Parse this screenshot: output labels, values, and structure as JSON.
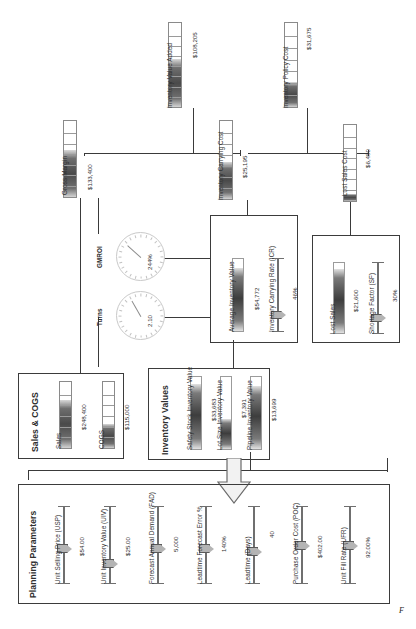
{
  "diagram": {
    "corner_mark": "F"
  },
  "top_metrics": [
    {
      "id": "inventory_value_added",
      "label": "Inventory Value Added",
      "value": "$108,205",
      "fill_pct": 57
    },
    {
      "id": "inventory_policy_cost",
      "label": "Inventory Policy Cost",
      "value": "$31,675",
      "fill_pct": 30
    },
    {
      "id": "gross_margin",
      "label": "Gross Margin",
      "value": "$133,400",
      "fill_pct": 62
    },
    {
      "id": "inventory_carrying_cost",
      "label": "Inventory Carrying Cost",
      "value": "$25,195",
      "fill_pct": 47
    },
    {
      "id": "lost_sales_cost",
      "label": "Lost Sales Cost",
      "value": "$6,480",
      "fill_pct": 9
    }
  ],
  "gauges": [
    {
      "id": "gmroi",
      "label": "GMROI",
      "value": "244%",
      "angle": 58
    },
    {
      "id": "turns",
      "label": "Turns",
      "value": "2.10",
      "angle": 40
    }
  ],
  "avg_inventory_group": {
    "title": "",
    "items": [
      {
        "id": "average_inventory_value",
        "label": "Average Inventory Value",
        "value": "$54,772",
        "type": "bar",
        "fill_pct": 88
      },
      {
        "id": "inventory_carrying_rate",
        "label": "Inventory Carrying Rate (ICR)",
        "value": "46%",
        "type": "slider",
        "pos_pct": 46
      }
    ]
  },
  "lost_sales_group": {
    "title": "",
    "items": [
      {
        "id": "lost_sales",
        "label": "Lost Sales",
        "value": "$21,600",
        "type": "bar",
        "fill_pct": 92
      },
      {
        "id": "shortage_factor",
        "label": "Shortage Factor (SF)",
        "value": "30%",
        "type": "slider",
        "pos_pct": 42
      }
    ]
  },
  "sales_cogs_group": {
    "title": "Sales & COGS",
    "items": [
      {
        "id": "sales",
        "label": "Sales",
        "value": "$248,400",
        "fill_pct": 72
      },
      {
        "id": "cogs",
        "label": "COGS",
        "value": "$115,000",
        "fill_pct": 36
      }
    ]
  },
  "inventory_values_group": {
    "title": "Inventory Values",
    "items": [
      {
        "id": "safety_stock_inventory_value",
        "label": "Safety Stock Inventory Value",
        "value": "$33,683",
        "fill_pct": 90
      },
      {
        "id": "lot_size_inventory_value",
        "label": "Lot Size Inventory Value",
        "value": "$7,391",
        "fill_pct": 42
      },
      {
        "id": "pipeline_inventory_value",
        "label": "Pipeline Inventory Value",
        "value": "$13,699",
        "fill_pct": 88
      }
    ]
  },
  "planning_parameters_group": {
    "title": "Planning Parameters",
    "items": [
      {
        "id": "unit_selling_price",
        "label": "Unit Selling Price (USP)",
        "value": "$54.00",
        "pos_pct": 40
      },
      {
        "id": "unit_inventory_value",
        "label": "Unit Inventory Value (UIV)",
        "value": "$25.00",
        "pos_pct": 62
      },
      {
        "id": "forecast_annual_demand",
        "label": "Forecast Annual Demand (FAD)",
        "value": "5,000",
        "pos_pct": 40
      },
      {
        "id": "leadtime_forecast_error",
        "label": "Leadtime Forecast Error %",
        "value": "140%",
        "pos_pct": 40
      },
      {
        "id": "leadtime_days",
        "label": "Leadtime (Days)",
        "value": "40",
        "pos_pct": 46
      },
      {
        "id": "purchase_order_cost",
        "label": "Purchase Order Cost (POC)",
        "value": "$402.00",
        "pos_pct": 44
      },
      {
        "id": "unit_fill_rate",
        "label": "Unit Fill Rate (UFR)",
        "value": "92.00%",
        "pos_pct": 42
      }
    ]
  }
}
